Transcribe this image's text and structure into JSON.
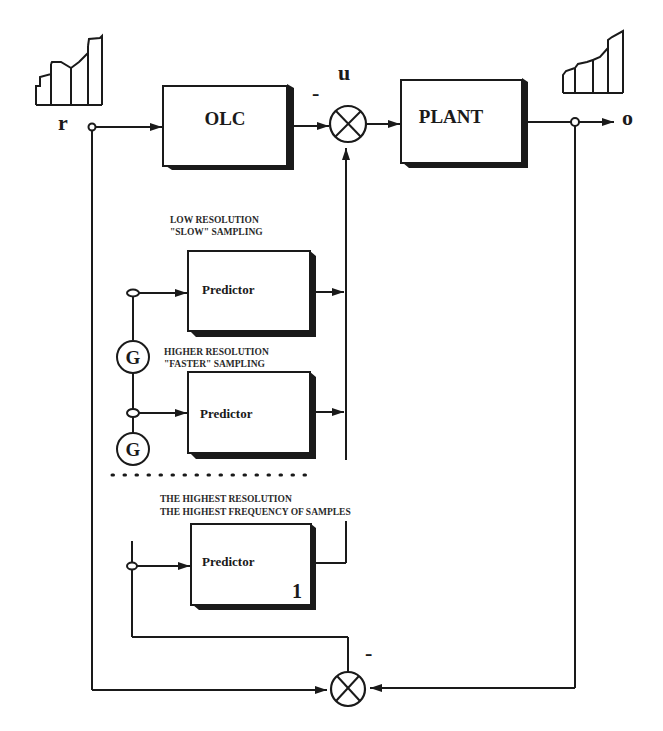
{
  "diagram": {
    "type": "control-block-diagram",
    "signals": {
      "reference": "r",
      "control": "u",
      "output": "o"
    },
    "blocks": {
      "olc": "OLC",
      "plant": "PLANT",
      "predictor_low": "Predictor",
      "predictor_high": "Predictor",
      "predictor_highest": "Predictor",
      "predictor_highest_index": "1"
    },
    "generators": [
      "G",
      "G"
    ],
    "signs": {
      "top_summer": "-",
      "bottom_summer": "-"
    },
    "annotations": {
      "low_line1": "LOW RESOLUTION",
      "low_line2": "\"SLOW\" SAMPLING",
      "higher_line1": "HIGHER RESOLUTION",
      "higher_line2": "\"FASTER\" SAMPLING",
      "highest_line1": "THE HIGHEST RESOLUTION",
      "highest_line2": "THE HIGHEST FREQUENCY OF SAMPLES"
    },
    "edges": [
      {
        "from": "r",
        "to": "OLC"
      },
      {
        "from": "OLC",
        "to": "top-summer",
        "sign": "-"
      },
      {
        "from": "top-summer",
        "to": "PLANT",
        "label": "u"
      },
      {
        "from": "PLANT",
        "to": "o"
      },
      {
        "from": "predictor-bus",
        "to": "top-summer"
      },
      {
        "from": "r",
        "to": "bottom-summer"
      },
      {
        "from": "o",
        "to": "bottom-summer"
      },
      {
        "from": "bottom-summer",
        "to": "predictor-input-bus",
        "sign": "-"
      },
      {
        "from": "predictor-input-bus",
        "to": "Predictor(low)",
        "via": "G"
      },
      {
        "from": "predictor-input-bus",
        "to": "Predictor(higher)",
        "via": "G"
      },
      {
        "from": "predictor-input-bus",
        "to": "Predictor(highest)"
      }
    ]
  }
}
